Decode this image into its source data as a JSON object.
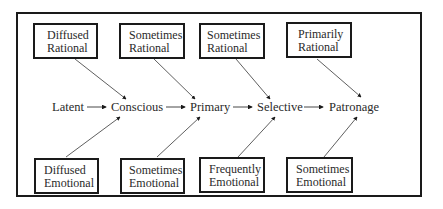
{
  "diagram": {
    "stages": [
      {
        "label": "Latent"
      },
      {
        "label": "Conscious"
      },
      {
        "label": "Primary"
      },
      {
        "label": "Selective"
      },
      {
        "label": "Patronage"
      }
    ],
    "top_boxes": [
      {
        "line1": "Diffused",
        "line2": "Rational",
        "target": "Conscious"
      },
      {
        "line1": "Sometimes",
        "line2": "Rational",
        "target": "Primary"
      },
      {
        "line1": "Sometimes",
        "line2": "Rational",
        "target": "Selective"
      },
      {
        "line1": "Primarily",
        "line2": "Rational",
        "target": "Patronage"
      }
    ],
    "bottom_boxes": [
      {
        "line1": "Diffused",
        "line2": "Emotional",
        "target": "Conscious"
      },
      {
        "line1": "Sometimes",
        "line2": "Emotional",
        "target": "Primary"
      },
      {
        "line1": "Frequently",
        "line2": "Emotional",
        "target": "Selective"
      },
      {
        "line1": "Sometimes",
        "line2": "Emotional",
        "target": "Patronage"
      }
    ],
    "colors": {
      "line": "#1a1a1a",
      "text": "#2a2a2a",
      "background": "#ffffff"
    }
  }
}
